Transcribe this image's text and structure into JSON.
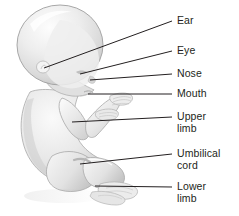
{
  "figure": {
    "style": "grayscale shaded illustration",
    "background_color": "#ffffff",
    "body_fill_light": "#f2f2f2",
    "body_fill_mid": "#dcdcdc",
    "body_fill_dark": "#b8b8b8",
    "body_outline": "#9a9a9a",
    "leader_line_color": "#231f20",
    "label_text_color": "#231f20"
  },
  "labels": [
    {
      "id": "ear",
      "text": "Ear",
      "x": 177,
      "y": 15
    },
    {
      "id": "eye",
      "text": "Eye",
      "x": 177,
      "y": 45
    },
    {
      "id": "nose",
      "text": "Nose",
      "x": 177,
      "y": 68
    },
    {
      "id": "mouth",
      "text": "Mouth",
      "x": 177,
      "y": 88
    },
    {
      "id": "upper-limb",
      "text": "Upper\nlimb",
      "x": 177,
      "y": 111
    },
    {
      "id": "umbilical-cord",
      "text": "Umbilical\ncord",
      "x": 177,
      "y": 148
    },
    {
      "id": "lower-limb",
      "text": "Lower\nlimb",
      "x": 177,
      "y": 181
    }
  ],
  "leader_lines": [
    {
      "id": "ear-leader",
      "x1": 44,
      "y1": 68,
      "x2": 172,
      "y2": 21
    },
    {
      "id": "eye-leader",
      "x1": 80,
      "y1": 74,
      "x2": 172,
      "y2": 51
    },
    {
      "id": "nose-leader",
      "x1": 90,
      "y1": 80,
      "x2": 172,
      "y2": 74
    },
    {
      "id": "mouth-leader",
      "x1": 88,
      "y1": 94,
      "x2": 172,
      "y2": 94
    },
    {
      "id": "upper-limb-leader",
      "x1": 72,
      "y1": 122,
      "x2": 172,
      "y2": 117
    },
    {
      "id": "umbilical-cord-leader",
      "x1": 80,
      "y1": 164,
      "x2": 172,
      "y2": 154
    },
    {
      "id": "lower-limb-leader",
      "x1": 95,
      "y1": 186,
      "x2": 172,
      "y2": 187
    }
  ]
}
